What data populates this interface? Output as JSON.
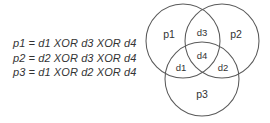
{
  "figure": {
    "background_color": "#ffffff",
    "stroke_color": "#5a5a5a",
    "text_color": "#333333"
  },
  "equations": {
    "lines": [
      "p1 = d1 XOR d3 XOR d4",
      "p2 = d2 XOR d3 XOR d4",
      "p3 = d1 XOR d2 XOR d4"
    ]
  },
  "venn": {
    "circles": [
      {
        "id": "p1",
        "label": "p1",
        "cx": 48,
        "cy": 41,
        "r": 37,
        "label_x": 34,
        "label_y": 35
      },
      {
        "id": "p2",
        "label": "p2",
        "cx": 87,
        "cy": 41,
        "r": 37,
        "label_x": 101,
        "label_y": 35
      },
      {
        "id": "p3",
        "label": "p3",
        "cx": 67,
        "cy": 79,
        "r": 37,
        "label_x": 67,
        "label_y": 95
      }
    ],
    "regions": [
      {
        "id": "d3",
        "label": "d3",
        "x": 67,
        "y": 33,
        "of": "p1 and p2"
      },
      {
        "id": "d1",
        "label": "d1",
        "x": 46,
        "y": 68,
        "of": "p1 and p3"
      },
      {
        "id": "d2",
        "label": "d2",
        "x": 88,
        "y": 68,
        "of": "p2 and p3"
      },
      {
        "id": "d4",
        "label": "d4",
        "x": 67,
        "y": 56,
        "of": "p1 and p2 and p3"
      }
    ]
  }
}
